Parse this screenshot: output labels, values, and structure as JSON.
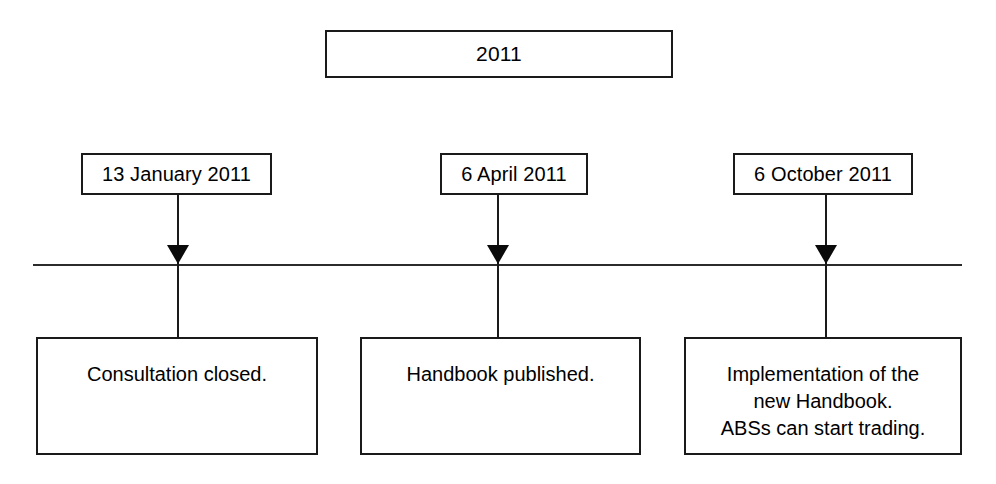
{
  "diagram": {
    "type": "timeline",
    "title": "2011",
    "axis": {
      "orientation": "horizontal",
      "color": "#2b2b2b"
    },
    "milestones": [
      {
        "date": "13 January 2011",
        "event_lines": [
          "Consultation closed."
        ]
      },
      {
        "date": "6 April 2011",
        "event_lines": [
          "Handbook published."
        ]
      },
      {
        "date": "6 October 2011",
        "event_lines": [
          "Implementation of the",
          "new Handbook.",
          "ABSs can start trading."
        ]
      }
    ]
  }
}
